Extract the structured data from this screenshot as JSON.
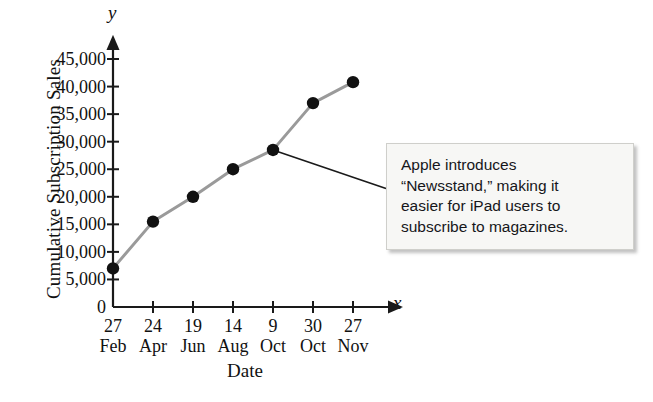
{
  "chart_data": {
    "type": "line",
    "title": "",
    "xlabel": "Date",
    "ylabel": "Cumulative Subscription Sales",
    "x_axis_variable": "x",
    "y_axis_variable": "y",
    "categories": [
      "27 Feb",
      "24 Apr",
      "19 Jun",
      "14 Aug",
      "9 Oct",
      "30 Oct",
      "27 Nov"
    ],
    "tick_days": [
      "27",
      "24",
      "19",
      "14",
      "9",
      "30",
      "27"
    ],
    "tick_months": [
      "Feb",
      "Apr",
      "Jun",
      "Aug",
      "Oct",
      "Oct",
      "Nov"
    ],
    "values": [
      7000,
      15500,
      20000,
      25000,
      28500,
      37000,
      40800
    ],
    "ylim": [
      0,
      47000
    ],
    "y_tick_values": [
      0,
      5000,
      10000,
      15000,
      20000,
      25000,
      30000,
      35000,
      40000,
      45000
    ],
    "y_tick_labels": [
      "0",
      "5,000",
      "10,000",
      "15,000",
      "20,000",
      "25,000",
      "30,000",
      "35,000",
      "40,000",
      "45,000"
    ],
    "grid": false,
    "legend": "none",
    "line_color": "#9a9a9a",
    "marker_color": "#111111",
    "axis_color": "#1a1a1a",
    "annotations": [
      {
        "name": "newsstand-callout",
        "text": "Apple introduces “Newsstand,” making it easier for iPad users to subscribe to magazines.",
        "lines": [
          "Apple introduces",
          "“Newsstand,” making it",
          "easier for iPad users to",
          "subscribe to magazines."
        ],
        "points_to_category": "9 Oct",
        "points_to_value": 28500,
        "background_color": "#f7f7f5",
        "border_color": "#cfcfcb"
      }
    ]
  }
}
